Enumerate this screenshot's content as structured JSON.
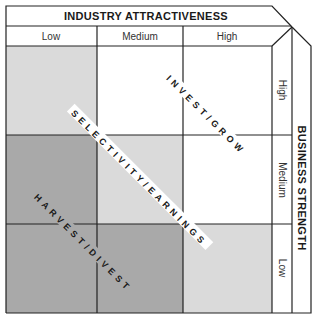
{
  "matrix": {
    "x_axis": {
      "title": "INDUSTRY ATTRACTIVENESS",
      "levels": [
        "Low",
        "Medium",
        "High"
      ]
    },
    "y_axis": {
      "title": "BUSINESS STRENGTH",
      "levels": [
        "High",
        "Medium",
        "Low"
      ]
    },
    "zones": [
      {
        "label": "INVEST/GROW",
        "color": "#ffffff"
      },
      {
        "label": "SELECTIVITY/EARNINGS",
        "color": "#dadada"
      },
      {
        "label": "HARVEST/DIVEST",
        "color": "#a9a9a9"
      }
    ],
    "cells": [
      [
        "light",
        "white",
        "white"
      ],
      [
        "dark",
        "light",
        "white"
      ],
      [
        "dark",
        "dark",
        "light"
      ]
    ],
    "colors": {
      "light": "#dadada",
      "dark": "#a9a9a9",
      "white": "#ffffff",
      "line": "#222222"
    }
  }
}
